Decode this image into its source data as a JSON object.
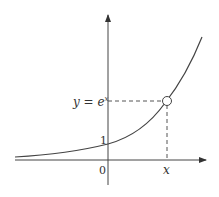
{
  "diagram": {
    "curve_label": "y = e^x",
    "curve_label_base": "y = e",
    "curve_label_exp": "x",
    "y_intercept_label": "1",
    "origin_label": "0",
    "x_point_label": "x",
    "colors": {
      "stroke": "#444444",
      "background": "#ffffff"
    }
  }
}
